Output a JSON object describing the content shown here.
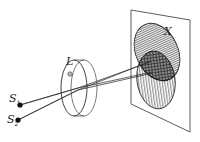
{
  "figure": {
    "type": "line-diagram",
    "background_color": "#ffffff",
    "stroke_color": "#1a1a1a"
  },
  "labels": {
    "source1": {
      "text": "S",
      "subscript": "1"
    },
    "source2": {
      "text": "S",
      "subscript": "2"
    },
    "lens": {
      "text": "L"
    },
    "screen": {
      "text": "X"
    }
  },
  "geometry": {
    "source1_point": {
      "x": 20,
      "y": 105
    },
    "source2_point": {
      "x": 18,
      "y": 120
    },
    "lens": {
      "front_center": {
        "x": 74,
        "y": 88
      },
      "back_center": {
        "x": 83,
        "y": 88
      },
      "rx": 14,
      "ry": 28,
      "axis_marker": {
        "x": 70,
        "y": 74,
        "r": 2
      }
    },
    "screen": {
      "top_left": {
        "x": 131,
        "y": 10
      },
      "top_right": {
        "x": 190,
        "y": 20
      },
      "bottom_right": {
        "x": 190,
        "y": 132
      },
      "bottom_left": {
        "x": 131,
        "y": 104
      }
    },
    "spot_upper": {
      "cx": 157,
      "cy": 52,
      "rx": 21,
      "ry": 30,
      "rotation": -25,
      "hatch": "horizontal"
    },
    "spot_lower": {
      "cx": 156,
      "cy": 80,
      "rx": 19,
      "ry": 29,
      "rotation": -8,
      "hatch": "vertical"
    },
    "rays": [
      {
        "from": "source1",
        "to": "spot_lower",
        "via_lens": true
      },
      {
        "from": "source1",
        "to": "spot_upper",
        "via_lens": true
      },
      {
        "from": "source2",
        "to": "spot_upper",
        "via_lens": true
      },
      {
        "from": "source2",
        "to": "spot_lower",
        "via_lens": true
      }
    ]
  },
  "colors": {
    "line": "#1a1a1a",
    "hatch": "#555555",
    "overlap_fill": "#707070",
    "screen_edge": "#4a4a4a"
  }
}
